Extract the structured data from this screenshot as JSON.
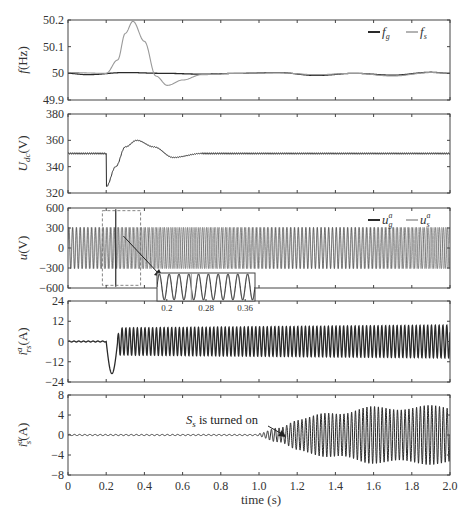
{
  "figure": {
    "xlabel": "time (s)",
    "x_ticks": [
      "0",
      "0.2",
      "0.4",
      "0.6",
      "0.8",
      "1.0",
      "1.2",
      "1.4",
      "1.6",
      "1.8",
      "2.0"
    ],
    "colors": {
      "dark": "#2a2a2a",
      "light": "#9a9a9a",
      "axis": "#444444"
    }
  },
  "panels": [
    {
      "ylabel": "f (Hz)",
      "y_ticks": [
        "50.2",
        "50.1",
        "50",
        "49.9"
      ],
      "legend": [
        {
          "label": "f_g",
          "text": "f",
          "sub": "g"
        },
        {
          "label": "f_s",
          "text": "f",
          "sub": "s"
        }
      ]
    },
    {
      "ylabel": "U_dc (V)",
      "y_ticks": [
        "380",
        "360",
        "340",
        "320"
      ]
    },
    {
      "ylabel": "u (V)",
      "y_ticks": [
        "600",
        "300",
        "0",
        "-300",
        "-600"
      ],
      "legend": [
        {
          "label": "u_g^a",
          "text": "u",
          "sub": "g",
          "sup": "a"
        },
        {
          "label": "u_s^a",
          "text": "u",
          "sub": "s",
          "sup": "a"
        }
      ],
      "inset": {
        "x_ticks": [
          "0.2",
          "0.28",
          "0.36"
        ]
      }
    },
    {
      "ylabel": "i_rs^a (A)",
      "y_ticks": [
        "24",
        "12",
        "0",
        "-12",
        "-24"
      ]
    },
    {
      "ylabel": "i_s^a (A)",
      "y_ticks": [
        "8",
        "4",
        "0",
        "-4",
        "-8"
      ],
      "annotation": "S_s is turned on"
    }
  ],
  "chart_data": [
    {
      "type": "line",
      "title": "",
      "xlabel": "time (s)",
      "ylabel": "f (Hz)",
      "xlim": [
        0,
        2.0
      ],
      "ylim": [
        49.9,
        50.2
      ],
      "legend_position": "upper right",
      "series": [
        {
          "name": "f_g",
          "x": [
            0,
            0.1,
            0.3,
            0.5,
            0.7,
            0.9,
            1.1,
            1.3,
            1.5,
            1.7,
            1.9,
            2.0
          ],
          "values": [
            50.0,
            49.995,
            50.003,
            50.0,
            49.997,
            50.0,
            50.003,
            49.992,
            50.0,
            49.993,
            50.004,
            50.0
          ]
        },
        {
          "name": "f_s",
          "x": [
            0,
            0.2,
            0.26,
            0.3,
            0.34,
            0.4,
            0.46,
            0.52,
            0.6,
            0.7,
            0.9,
            1.1,
            1.3,
            1.5,
            1.7,
            1.9,
            2.0
          ],
          "values": [
            50.003,
            50.0,
            50.05,
            50.15,
            50.195,
            50.12,
            49.99,
            49.955,
            49.975,
            49.995,
            50.0,
            50.002,
            49.995,
            50.0,
            49.99,
            50.003,
            50.0
          ]
        }
      ]
    },
    {
      "type": "line",
      "xlabel": "time (s)",
      "ylabel": "U_dc (V)",
      "xlim": [
        0,
        2.0
      ],
      "ylim": [
        320,
        380
      ],
      "series": [
        {
          "name": "U_dc",
          "x": [
            0,
            0.2,
            0.201,
            0.25,
            0.3,
            0.36,
            0.45,
            0.55,
            0.7,
            0.9,
            1.2,
            1.6,
            2.0
          ],
          "values": [
            350,
            350,
            325,
            340,
            355,
            360,
            355,
            347,
            350,
            350,
            350,
            350,
            350
          ]
        }
      ]
    },
    {
      "type": "line",
      "xlabel": "time (s)",
      "ylabel": "u (V)",
      "xlim": [
        0,
        2.0
      ],
      "ylim": [
        -600,
        600
      ],
      "legend_position": "upper right",
      "series": [
        {
          "name": "u_g^a",
          "description": "50 Hz sinusoid, amplitude ~310 V, spike to ~±580 at t=0.25",
          "amplitude": 310,
          "frequency_hz": 50
        },
        {
          "name": "u_s^a",
          "description": "sinusoid, amplitude ~310 V, beating with u_g^a",
          "amplitude": 310,
          "frequency_hz": 50
        }
      ],
      "inset": {
        "xlim": [
          0.18,
          0.38
        ],
        "x_ticks": [
          0.2,
          0.28,
          0.36
        ]
      }
    },
    {
      "type": "line",
      "xlabel": "time (s)",
      "ylabel": "i_rs^a (A)",
      "xlim": [
        0,
        2.0
      ],
      "ylim": [
        -24,
        24
      ],
      "series": [
        {
          "name": "i_rs^a",
          "x": [
            0,
            0.2,
            0.23,
            0.26,
            0.3,
            0.6,
            1.0,
            2.0
          ],
          "values": [
            0,
            0,
            -19,
            0,
            8,
            8,
            9,
            10
          ],
          "description": "zero until 0.2 s, dip to -19 A, then 50 Hz oscillation amplitude ~8-10 A"
        }
      ]
    },
    {
      "type": "line",
      "xlabel": "time (s)",
      "ylabel": "i_s^a (A)",
      "xlim": [
        0,
        2.0
      ],
      "ylim": [
        -8,
        8
      ],
      "annotation": {
        "text": "S_s is turned on",
        "x": 1.0,
        "y": 0
      },
      "series": [
        {
          "name": "i_s^a",
          "x": [
            0,
            1.0,
            1.1,
            1.2,
            1.4,
            1.6,
            1.8,
            2.0
          ],
          "envelope": [
            0,
            0.3,
            1.5,
            3.0,
            4.5,
            5.3,
            5.5,
            5.5
          ],
          "description": "near-zero until 1.0 s, then growing oscillation envelope to ~±5.5 A"
        }
      ]
    }
  ]
}
